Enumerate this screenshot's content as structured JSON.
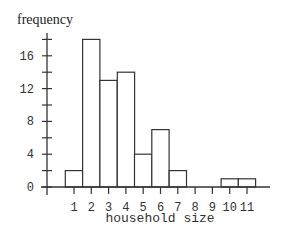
{
  "chart_data": {
    "type": "bar",
    "title": "",
    "xlabel": "household size",
    "ylabel": "frequency",
    "categories": [
      "1",
      "2",
      "3",
      "4",
      "5",
      "6",
      "7",
      "8",
      "9",
      "10",
      "11"
    ],
    "values": [
      2,
      18,
      13,
      14,
      4,
      7,
      2,
      0,
      0,
      1,
      1
    ],
    "ylim": [
      0,
      18
    ],
    "y_tick_labels": [
      "0",
      "4",
      "8",
      "12",
      "16"
    ],
    "y_minor_ticks": [
      0,
      2,
      4,
      6,
      8,
      10,
      12,
      14,
      16,
      18
    ],
    "grid": false,
    "legend": null,
    "histogram": true
  }
}
